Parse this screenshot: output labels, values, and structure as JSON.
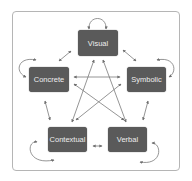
{
  "diagram": {
    "nodes": [
      {
        "id": "visual",
        "label": "Visual"
      },
      {
        "id": "concrete",
        "label": "Concrete"
      },
      {
        "id": "symbolic",
        "label": "Symbolic"
      },
      {
        "id": "contextual",
        "label": "Contextual"
      },
      {
        "id": "verbal",
        "label": "Verbal"
      }
    ],
    "edges": [
      {
        "from": "visual",
        "to": "visual",
        "type": "self-loop"
      },
      {
        "from": "concrete",
        "to": "concrete",
        "type": "self-loop"
      },
      {
        "from": "symbolic",
        "to": "symbolic",
        "type": "self-loop"
      },
      {
        "from": "contextual",
        "to": "contextual",
        "type": "self-loop"
      },
      {
        "from": "verbal",
        "to": "verbal",
        "type": "self-loop"
      },
      {
        "from": "visual",
        "to": "concrete",
        "type": "bidirectional"
      },
      {
        "from": "visual",
        "to": "symbolic",
        "type": "bidirectional"
      },
      {
        "from": "visual",
        "to": "contextual",
        "type": "bidirectional"
      },
      {
        "from": "visual",
        "to": "verbal",
        "type": "bidirectional"
      },
      {
        "from": "concrete",
        "to": "symbolic",
        "type": "bidirectional"
      },
      {
        "from": "concrete",
        "to": "contextual",
        "type": "bidirectional"
      },
      {
        "from": "concrete",
        "to": "verbal",
        "type": "bidirectional"
      },
      {
        "from": "symbolic",
        "to": "contextual",
        "type": "bidirectional"
      },
      {
        "from": "symbolic",
        "to": "verbal",
        "type": "bidirectional"
      },
      {
        "from": "contextual",
        "to": "verbal",
        "type": "bidirectional"
      }
    ],
    "colors": {
      "node_fill": "#5a5a5a",
      "node_text": "#eeeeee",
      "line": "#6e6e6e",
      "frame": "#b5b5b5"
    }
  }
}
